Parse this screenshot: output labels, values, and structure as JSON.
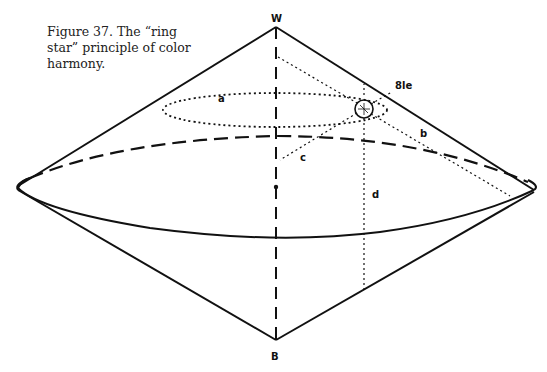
{
  "caption": "Figure 37. The “ring star” principle of color harmony.",
  "labels": {
    "top": "W",
    "bottom": "B",
    "hue": "8le",
    "a": "a",
    "b": "b",
    "c": "c",
    "d": "d"
  }
}
